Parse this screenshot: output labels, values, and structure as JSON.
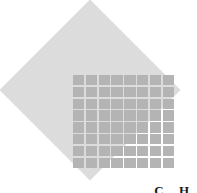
{
  "figure": {
    "background_color": "#ffffff",
    "diamond": {
      "name": "rotated-square",
      "fill_color": "#dcdcdc",
      "rotation_degrees": 45
    },
    "grid": {
      "name": "cell-grid",
      "rows": 8,
      "columns": 8,
      "cell_color": "#b4b4b4",
      "line_color": "#dcdcdc"
    },
    "corner_label": "C  H"
  },
  "chart_data": {
    "type": "heatmap",
    "title": "",
    "xlabel": "",
    "ylabel": "",
    "rows": 8,
    "columns": 8,
    "annotations": [
      "C  H"
    ],
    "values": [
      [
        1,
        1,
        1,
        1,
        1,
        1,
        1,
        1
      ],
      [
        1,
        1,
        1,
        1,
        1,
        1,
        1,
        1
      ],
      [
        1,
        1,
        1,
        1,
        1,
        1,
        1,
        1
      ],
      [
        1,
        1,
        1,
        1,
        1,
        1,
        1,
        1
      ],
      [
        1,
        1,
        1,
        1,
        1,
        1,
        1,
        1
      ],
      [
        1,
        1,
        1,
        1,
        1,
        1,
        1,
        1
      ],
      [
        1,
        1,
        1,
        1,
        1,
        1,
        1,
        1
      ],
      [
        1,
        1,
        1,
        1,
        1,
        1,
        1,
        1
      ]
    ]
  }
}
